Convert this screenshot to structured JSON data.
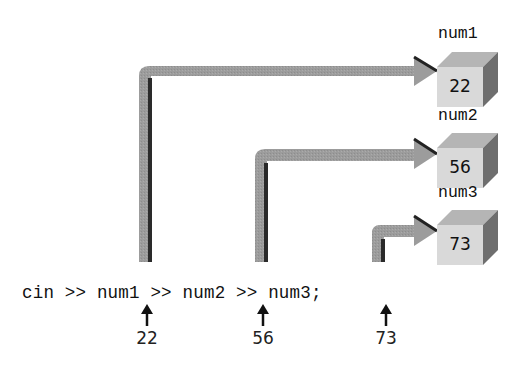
{
  "code": {
    "line": "cin >> num1 >> num2 >> num3;",
    "tokens": [
      "cin",
      ">>",
      "num1",
      ">>",
      "num2",
      ">>",
      "num3;"
    ]
  },
  "inputs": [
    {
      "variable": "num1",
      "value": "22"
    },
    {
      "variable": "num2",
      "value": "56"
    },
    {
      "variable": "num3",
      "value": "73"
    }
  ],
  "boxes": [
    {
      "label": "num1",
      "value": "22"
    },
    {
      "label": "num2",
      "value": "56"
    },
    {
      "label": "num3",
      "value": "73"
    }
  ],
  "colors": {
    "pipe": "#9a9a9a",
    "pipe_shadow": "#2a2a2a",
    "box_front": "#d9d9d9",
    "box_top": "#b5b5b5",
    "box_side": "#6e6e6e",
    "text": "#111111"
  }
}
